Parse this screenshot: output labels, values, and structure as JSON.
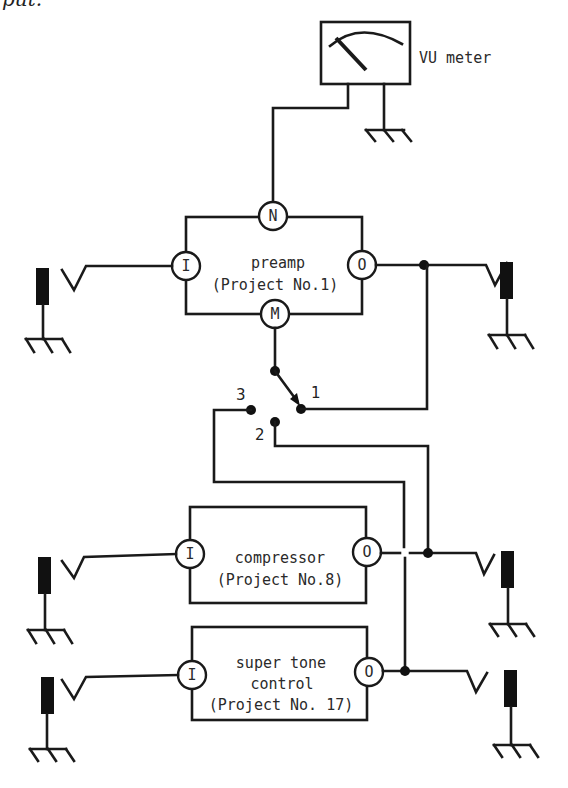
{
  "caption_fragment": "put.",
  "vu_meter": {
    "label": "VU meter"
  },
  "modules": [
    {
      "id": "preamp",
      "name": "preamp",
      "project": "(Project No.1)",
      "terminals": {
        "top": "N",
        "left": "I",
        "right": "O",
        "bottom": "M"
      }
    },
    {
      "id": "compressor",
      "name": "compressor",
      "project": "(Project No.8)",
      "terminals": {
        "left": "I",
        "right": "O"
      }
    },
    {
      "id": "super-tone-control",
      "name_line1": "super tone",
      "name_line2": "control",
      "project": "(Project No. 17)",
      "terminals": {
        "left": "I",
        "right": "O"
      }
    }
  ],
  "switch": {
    "positions": [
      "1",
      "2",
      "3"
    ]
  },
  "colors": {
    "ink": "#1a1a1a",
    "background": "#ffffff"
  }
}
